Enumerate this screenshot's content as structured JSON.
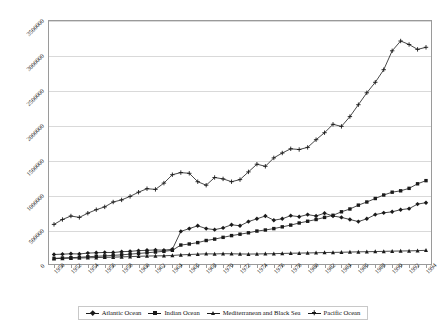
{
  "chart_data": {
    "type": "line",
    "title": "",
    "subtitle": "",
    "xlabel": "",
    "ylabel": "",
    "grid": true,
    "legend_position": "bottom",
    "xlim": [
      1950,
      1994
    ],
    "ylim": [
      0,
      3500000
    ],
    "ytick_labels": [
      "0",
      "500000",
      "1000000",
      "1500000",
      "2000000",
      "2500000",
      "3000000",
      "3500000"
    ],
    "ytick_values": [
      0,
      500000,
      1000000,
      1500000,
      2000000,
      2500000,
      3000000,
      3500000
    ],
    "xtick_labels": [
      "1950",
      "1952",
      "1954",
      "1956",
      "1958",
      "1960",
      "1962",
      "1964",
      "1966",
      "1968",
      "1970",
      "1972",
      "1974",
      "1976",
      "1978",
      "1980",
      "1982",
      "1984",
      "1986",
      "1988",
      "1990",
      "1992",
      "1994"
    ],
    "x": [
      1950,
      1951,
      1952,
      1953,
      1954,
      1955,
      1956,
      1957,
      1958,
      1959,
      1960,
      1961,
      1962,
      1963,
      1964,
      1965,
      1966,
      1967,
      1968,
      1969,
      1970,
      1971,
      1972,
      1973,
      1974,
      1975,
      1976,
      1977,
      1978,
      1979,
      1980,
      1981,
      1982,
      1983,
      1984,
      1985,
      1986,
      1987,
      1988,
      1989,
      1990,
      1991,
      1992,
      1993,
      1994
    ],
    "series": [
      {
        "name": "Atlantic Ocean",
        "marker": "diamond",
        "values": [
          150000,
          155000,
          160000,
          158000,
          170000,
          175000,
          180000,
          178000,
          190000,
          195000,
          205000,
          210000,
          215000,
          212000,
          225000,
          480000,
          520000,
          560000,
          520000,
          505000,
          530000,
          575000,
          560000,
          620000,
          660000,
          700000,
          640000,
          660000,
          705000,
          690000,
          720000,
          700000,
          740000,
          700000,
          680000,
          650000,
          620000,
          660000,
          720000,
          745000,
          760000,
          790000,
          805000,
          870000,
          890000
        ]
      },
      {
        "name": "Indian Ocean",
        "marker": "square",
        "values": [
          95000,
          100000,
          105000,
          110000,
          118000,
          125000,
          130000,
          138000,
          145000,
          155000,
          165000,
          175000,
          185000,
          195000,
          210000,
          285000,
          300000,
          320000,
          350000,
          370000,
          395000,
          420000,
          440000,
          460000,
          485000,
          500000,
          520000,
          545000,
          570000,
          600000,
          625000,
          650000,
          680000,
          710000,
          760000,
          800000,
          855000,
          900000,
          950000,
          1000000,
          1040000,
          1060000,
          1095000,
          1160000,
          1205000
        ]
      },
      {
        "name": "Mediterranean and Black Sea",
        "marker": "triangle",
        "values": [
          90000,
          95000,
          98000,
          100000,
          103000,
          106000,
          110000,
          112000,
          116000,
          120000,
          124000,
          128000,
          130000,
          132000,
          136000,
          145000,
          150000,
          155000,
          160000,
          158000,
          162000,
          160000,
          158000,
          156000,
          158000,
          160000,
          162000,
          165000,
          168000,
          170000,
          172000,
          175000,
          178000,
          180000,
          182000,
          185000,
          188000,
          190000,
          192000,
          195000,
          198000,
          200000,
          202000,
          205000,
          210000
        ]
      },
      {
        "name": "Pacific Ocean",
        "marker": "cross",
        "values": [
          580000,
          650000,
          700000,
          680000,
          740000,
          790000,
          830000,
          900000,
          930000,
          980000,
          1040000,
          1090000,
          1080000,
          1170000,
          1290000,
          1320000,
          1310000,
          1190000,
          1140000,
          1250000,
          1230000,
          1190000,
          1220000,
          1330000,
          1440000,
          1410000,
          1530000,
          1600000,
          1660000,
          1650000,
          1680000,
          1790000,
          1890000,
          2010000,
          1980000,
          2120000,
          2290000,
          2460000,
          2610000,
          2790000,
          3060000,
          3200000,
          3150000,
          3080000,
          3110000
        ]
      }
    ],
    "legend": [
      "Atlantic Ocean",
      "Indian Ocean",
      "Mediterranean and Black Sea",
      "Pacific Ocean"
    ]
  }
}
